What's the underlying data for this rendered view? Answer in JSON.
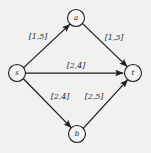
{
  "diagram": {
    "background_color": "#f1f1f0",
    "stroke_color": "#1c1c1c",
    "node_fill_color": "#f4f4f3",
    "label_color": "#2a2a2a",
    "nodes": [
      {
        "id": "s",
        "label": "s",
        "cx": 17,
        "cy": 73,
        "r": 8.5
      },
      {
        "id": "a",
        "label": "a",
        "cx": 76,
        "cy": 18,
        "r": 8.5
      },
      {
        "id": "b",
        "label": "b",
        "cx": 77,
        "cy": 134,
        "r": 8.5
      },
      {
        "id": "t",
        "label": "t",
        "cx": 133,
        "cy": 73,
        "r": 8.5
      }
    ],
    "edges": [
      {
        "id": "s-a",
        "from": "s",
        "to": "a",
        "label": "[1,5]",
        "label_x": 38,
        "label_y": 36
      },
      {
        "id": "a-t",
        "from": "a",
        "to": "t",
        "label": "[1,3]",
        "label_x": 114,
        "label_y": 37
      },
      {
        "id": "s-t",
        "from": "s",
        "to": "t",
        "label": "[2,4]",
        "label_x": 76,
        "label_y": 65
      },
      {
        "id": "s-b",
        "from": "s",
        "to": "b",
        "label": "[2,4]",
        "label_x": 60,
        "label_y": 96
      },
      {
        "id": "b-t",
        "from": "b",
        "to": "t",
        "label": "[2,5]",
        "label_x": 94,
        "label_y": 96
      }
    ]
  }
}
